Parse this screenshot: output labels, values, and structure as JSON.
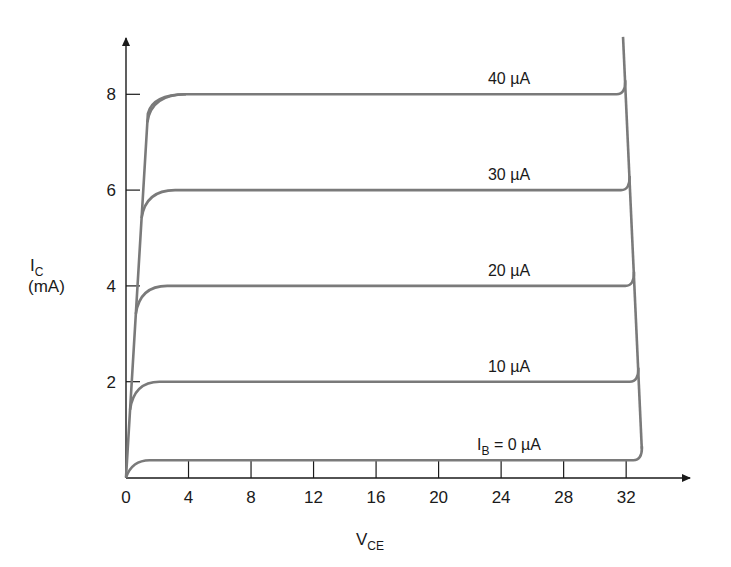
{
  "chart_data": {
    "type": "line",
    "title": "",
    "xlabel": "V",
    "xlabel_sub": "CE",
    "ylabel": "I",
    "ylabel_sub": "C",
    "ylabel_unit": "(mA)",
    "xlim": [
      0,
      36
    ],
    "ylim": [
      0,
      9
    ],
    "grid": false,
    "x_ticks": [
      0,
      4,
      8,
      12,
      16,
      20,
      24,
      28,
      32
    ],
    "x_tick_labels": [
      "0",
      "4",
      "8",
      "12",
      "16",
      "20",
      "24",
      "28",
      "32"
    ],
    "y_ticks": [
      2,
      4,
      6,
      8
    ],
    "y_tick_labels": [
      "2",
      "4",
      "6",
      "8"
    ],
    "series": [
      {
        "name": "I_B = 0 µA",
        "label_prefix": "I",
        "label_sub": "B",
        "label_rest": " = 0 µA",
        "ib_uA": 0,
        "ic_mA": 0.36,
        "knee_V": 1.0,
        "breakdown_V": 32.9
      },
      {
        "name": "10 µA",
        "label": "10 µA",
        "ib_uA": 10,
        "ic_mA": 2.0,
        "knee_V": 1.5,
        "breakdown_V": 32.6
      },
      {
        "name": "20 µA",
        "label": "20 µA",
        "ib_uA": 20,
        "ic_mA": 4.0,
        "knee_V": 2.0,
        "breakdown_V": 32.3
      },
      {
        "name": "30 µA",
        "label": "30 µA",
        "ib_uA": 30,
        "ic_mA": 6.0,
        "knee_V": 2.5,
        "breakdown_V": 32.1
      },
      {
        "name": "40 µA",
        "label": "40 µA",
        "ib_uA": 40,
        "ic_mA": 8.0,
        "knee_V": 3.2,
        "breakdown_V": 31.9
      }
    ],
    "saturation_line": {
      "points": [
        [
          0,
          0
        ],
        [
          1.4,
          7.6
        ]
      ]
    },
    "breakdown_line": {
      "points": [
        [
          33.0,
          0.6
        ],
        [
          31.8,
          9.2
        ]
      ]
    },
    "colors": {
      "curves": "#7a7a7a",
      "axes": "#1a1a1a"
    }
  }
}
